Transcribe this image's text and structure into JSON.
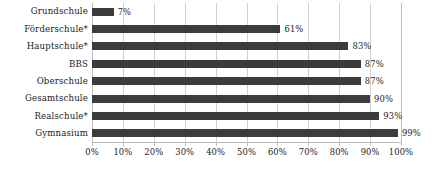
{
  "chart_data": {
    "type": "bar",
    "orientation": "horizontal",
    "title": "",
    "subtitle": "",
    "xlabel": "",
    "ylabel": "",
    "categories": [
      "Grundschule",
      "Förderschule*",
      "Hauptschule*",
      "BBS",
      "Oberschule",
      "Gesamtschule",
      "Realschule*",
      "Gymnasium"
    ],
    "values": [
      7,
      61,
      83,
      87,
      87,
      90,
      93,
      99
    ],
    "data_labels": [
      "7%",
      "61%",
      "83%",
      "87%",
      "87%",
      "90%",
      "93%",
      "99%"
    ],
    "xlim": [
      0,
      100
    ],
    "xticks": [
      0,
      10,
      20,
      30,
      40,
      50,
      60,
      70,
      80,
      90,
      100
    ],
    "xtick_labels": [
      "0%",
      "10%",
      "20%",
      "30%",
      "40%",
      "50%",
      "60%",
      "70%",
      "80%",
      "90%",
      "100%"
    ],
    "grid": "vertical",
    "legend": "none",
    "bar_color": "#3c3c3c",
    "gridline_color": "#d0d0d0",
    "axis_color": "#b9b9b9",
    "text_color": "#1b1b1b"
  }
}
